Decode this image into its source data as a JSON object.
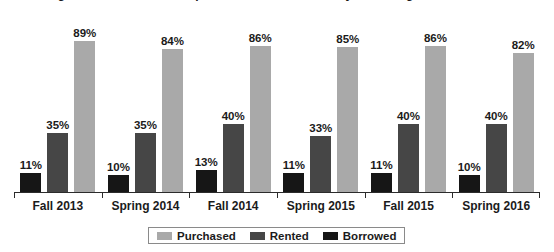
{
  "chart_data": {
    "type": "bar",
    "title": "Percentage of students who acquired course materials by obtaining method",
    "subtitle": "",
    "xlabel": "",
    "ylabel": "",
    "ylim": [
      0,
      100
    ],
    "grid": false,
    "legend_position": "bottom",
    "value_suffix": "%",
    "bar_order": [
      "Borrowed",
      "Rented",
      "Purchased"
    ],
    "categories": [
      "Fall 2013",
      "Spring 2014",
      "Fall 2014",
      "Spring 2015",
      "Fall 2015",
      "Spring 2016"
    ],
    "series": [
      {
        "name": "Purchased",
        "color": "#a9a9a9",
        "values": [
          89,
          84,
          86,
          85,
          86,
          82
        ],
        "labels": [
          "89%",
          "84%",
          "86%",
          "85%",
          "86%",
          "82%"
        ]
      },
      {
        "name": "Rented",
        "color": "#464646",
        "values": [
          35,
          35,
          40,
          33,
          40,
          40
        ],
        "labels": [
          "35%",
          "35%",
          "40%",
          "33%",
          "40%",
          "40%"
        ]
      },
      {
        "name": "Borrowed",
        "color": "#161616",
        "values": [
          11,
          10,
          13,
          11,
          11,
          10
        ],
        "labels": [
          "11%",
          "10%",
          "13%",
          "11%",
          "11%",
          "10%"
        ]
      }
    ]
  },
  "legend": {
    "items": [
      {
        "label": "Purchased",
        "swatch": "purchased"
      },
      {
        "label": "Rented",
        "swatch": "rented"
      },
      {
        "label": "Borrowed",
        "swatch": "borrowed"
      }
    ]
  },
  "colors": {
    "purchased": "#a9a9a9",
    "rented": "#464646",
    "borrowed": "#161616",
    "axis": "#2b2b2b",
    "text": "#1b1b1b",
    "background": "#ffffff"
  }
}
